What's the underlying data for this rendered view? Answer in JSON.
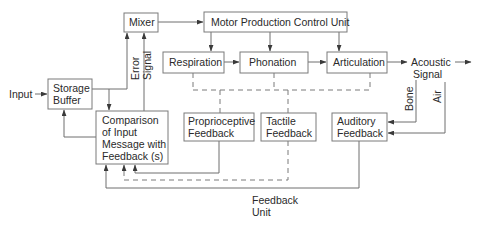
{
  "diagram": {
    "type": "block-diagram",
    "title": "",
    "nodes": {
      "input": {
        "label": "Input"
      },
      "storage_buffer": {
        "label_lines": [
          "Storage",
          "Buffer"
        ]
      },
      "mixer": {
        "label": "Mixer"
      },
      "motor_unit": {
        "label": "Motor Production Control Unit"
      },
      "respiration": {
        "label": "Respiration"
      },
      "phonation": {
        "label": "Phonation"
      },
      "articulation": {
        "label": "Articulation"
      },
      "acoustic_signal": {
        "label_lines": [
          "Acoustic",
          "Signal"
        ]
      },
      "comparison": {
        "label_lines": [
          "Comparison",
          "of Input",
          "Message with",
          "Feedback (s)"
        ]
      },
      "proprioceptive": {
        "label_lines": [
          "Proprioceptive",
          "Feedback"
        ]
      },
      "tactile": {
        "label_lines": [
          "Tactile",
          "Feedback"
        ]
      },
      "auditory": {
        "label_lines": [
          "Auditory",
          "Feedback"
        ]
      },
      "feedback_unit": {
        "label_lines": [
          "Feedback",
          "Unit"
        ]
      }
    },
    "edge_labels": {
      "error_signal": [
        "Error",
        "Signal"
      ],
      "bone": "Bone",
      "air": "Air"
    },
    "edges": [
      {
        "from": "input",
        "to": "storage_buffer",
        "style": "solid"
      },
      {
        "from": "storage_buffer",
        "to": "mixer",
        "style": "solid"
      },
      {
        "from": "storage_buffer",
        "to": "comparison",
        "style": "solid"
      },
      {
        "from": "comparison",
        "to": "mixer",
        "style": "solid",
        "label": "Error Signal"
      },
      {
        "from": "comparison",
        "to": "storage_buffer",
        "style": "solid"
      },
      {
        "from": "mixer",
        "to": "motor_unit",
        "style": "solid"
      },
      {
        "from": "motor_unit",
        "to": "respiration",
        "style": "solid"
      },
      {
        "from": "motor_unit",
        "to": "phonation",
        "style": "solid"
      },
      {
        "from": "motor_unit",
        "to": "articulation",
        "style": "solid"
      },
      {
        "from": "respiration",
        "to": "phonation",
        "style": "solid"
      },
      {
        "from": "phonation",
        "to": "articulation",
        "style": "solid"
      },
      {
        "from": "articulation",
        "to": "acoustic_signal",
        "style": "solid"
      },
      {
        "from": "acoustic_signal",
        "to": "output",
        "style": "solid"
      },
      {
        "from": "respiration",
        "to": "proprioceptive",
        "style": "dashed"
      },
      {
        "from": "phonation",
        "to": "tactile",
        "style": "dashed"
      },
      {
        "from": "articulation",
        "to": "proprioceptive",
        "style": "dashed"
      },
      {
        "from": "acoustic_signal",
        "to": "auditory",
        "style": "solid",
        "label": "Bone"
      },
      {
        "from": "acoustic_signal",
        "to": "auditory",
        "style": "solid",
        "label": "Air"
      },
      {
        "from": "proprioceptive",
        "to": "comparison",
        "style": "solid"
      },
      {
        "from": "tactile",
        "to": "comparison",
        "style": "dashed"
      },
      {
        "from": "auditory",
        "to": "comparison",
        "style": "solid"
      }
    ]
  }
}
